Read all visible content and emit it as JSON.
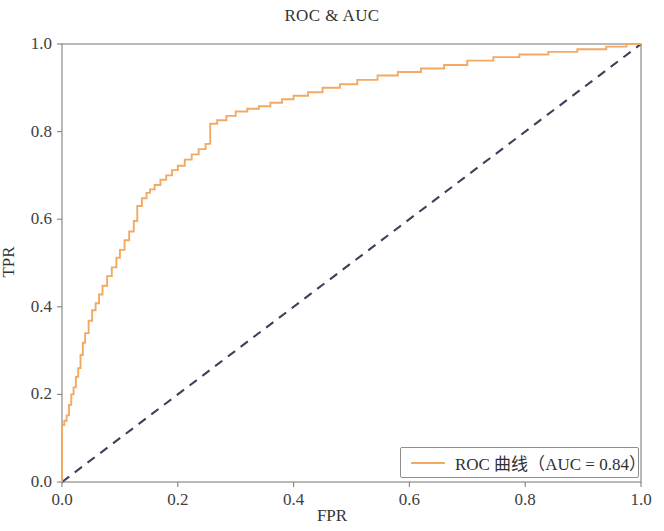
{
  "chart_data": {
    "type": "line",
    "title": "ROC & AUC",
    "xlabel": "FPR",
    "ylabel": "TPR",
    "xlim": [
      0.0,
      1.0
    ],
    "ylim": [
      0.0,
      1.0
    ],
    "grid": false,
    "legend_position": "lower right",
    "xticks": [
      "0.0",
      "0.2",
      "0.4",
      "0.6",
      "0.8",
      "1.0"
    ],
    "xtick_values": [
      0.0,
      0.2,
      0.4,
      0.6,
      0.8,
      1.0
    ],
    "yticks": [
      "0.0",
      "0.2",
      "0.4",
      "0.6",
      "0.8",
      "1.0"
    ],
    "ytick_values": [
      0.0,
      0.2,
      0.4,
      0.6,
      0.8,
      1.0
    ],
    "auc": 0.84,
    "series": [
      {
        "name": "ROC 曲线（AUC = 0.84）",
        "color": "#f2a964",
        "linestyle": "solid",
        "drawstyle": "steps-post",
        "x": [
          0.0,
          0.0,
          0.004,
          0.004,
          0.008,
          0.008,
          0.012,
          0.012,
          0.016,
          0.016,
          0.02,
          0.02,
          0.024,
          0.024,
          0.028,
          0.028,
          0.032,
          0.032,
          0.036,
          0.036,
          0.04,
          0.04,
          0.046,
          0.046,
          0.052,
          0.052,
          0.058,
          0.058,
          0.064,
          0.064,
          0.07,
          0.07,
          0.078,
          0.078,
          0.086,
          0.086,
          0.094,
          0.094,
          0.1,
          0.1,
          0.108,
          0.108,
          0.116,
          0.116,
          0.124,
          0.124,
          0.13,
          0.13,
          0.138,
          0.138,
          0.146,
          0.146,
          0.152,
          0.152,
          0.16,
          0.16,
          0.17,
          0.17,
          0.18,
          0.18,
          0.19,
          0.19,
          0.2,
          0.2,
          0.212,
          0.212,
          0.224,
          0.224,
          0.236,
          0.236,
          0.248,
          0.248,
          0.256,
          0.256,
          0.268,
          0.268,
          0.284,
          0.284,
          0.3,
          0.3,
          0.32,
          0.32,
          0.34,
          0.34,
          0.36,
          0.36,
          0.38,
          0.38,
          0.4,
          0.4,
          0.425,
          0.425,
          0.45,
          0.45,
          0.48,
          0.48,
          0.51,
          0.51,
          0.545,
          0.545,
          0.58,
          0.58,
          0.62,
          0.62,
          0.66,
          0.66,
          0.7,
          0.7,
          0.745,
          0.745,
          0.79,
          0.79,
          0.84,
          0.84,
          0.89,
          0.89,
          0.94,
          0.94,
          0.975,
          0.975,
          1.0
        ],
        "y": [
          0.0,
          0.13,
          0.13,
          0.14,
          0.14,
          0.152,
          0.152,
          0.176,
          0.176,
          0.2,
          0.2,
          0.216,
          0.216,
          0.24,
          0.24,
          0.26,
          0.26,
          0.29,
          0.29,
          0.318,
          0.318,
          0.34,
          0.34,
          0.368,
          0.368,
          0.392,
          0.392,
          0.408,
          0.408,
          0.428,
          0.428,
          0.448,
          0.448,
          0.47,
          0.47,
          0.49,
          0.49,
          0.512,
          0.512,
          0.53,
          0.53,
          0.552,
          0.552,
          0.572,
          0.572,
          0.596,
          0.596,
          0.63,
          0.63,
          0.648,
          0.648,
          0.66,
          0.66,
          0.668,
          0.668,
          0.678,
          0.678,
          0.69,
          0.69,
          0.7,
          0.7,
          0.712,
          0.712,
          0.722,
          0.722,
          0.736,
          0.736,
          0.748,
          0.748,
          0.76,
          0.76,
          0.772,
          0.772,
          0.818,
          0.818,
          0.826,
          0.826,
          0.836,
          0.836,
          0.846,
          0.846,
          0.852,
          0.852,
          0.858,
          0.858,
          0.866,
          0.866,
          0.874,
          0.874,
          0.882,
          0.882,
          0.89,
          0.89,
          0.9,
          0.9,
          0.908,
          0.908,
          0.918,
          0.918,
          0.928,
          0.928,
          0.936,
          0.936,
          0.944,
          0.944,
          0.952,
          0.952,
          0.962,
          0.962,
          0.97,
          0.97,
          0.976,
          0.976,
          0.982,
          0.982,
          0.988,
          0.988,
          0.994,
          0.994,
          1.0,
          1.0
        ]
      },
      {
        "name": "chance-diagonal",
        "color": "#3b4257",
        "linestyle": "dashed",
        "x": [
          0.0,
          1.0
        ],
        "y": [
          0.0,
          1.0
        ]
      }
    ]
  },
  "legend": {
    "entry_label": "ROC 曲线（AUC = 0.84）"
  },
  "colors": {
    "roc_line": "#f2a964",
    "diagonal": "#3b4257",
    "axis": "#808080",
    "text": "#333333"
  }
}
